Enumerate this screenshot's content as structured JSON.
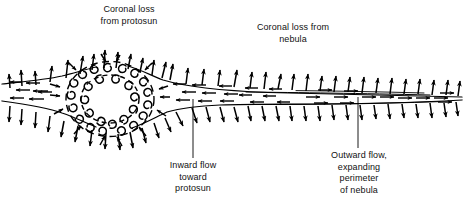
{
  "figure": {
    "kind": "scientific-line-diagram",
    "ink_color": "#000000",
    "background_color": "#ffffff"
  },
  "labels": {
    "coronal_loss_protosun": "Coronal loss\nfrom protosun",
    "coronal_loss_nebula": "Coronal loss from\nnebula",
    "inward_flow": "Inward flow\ntoward\nprotosun",
    "outward_flow": "Outward flow,\nexpanding\nperimeter\nof nebula"
  },
  "chart_data": {
    "type": "diagram",
    "elements": [
      {
        "name": "protosun-core",
        "shape": "annulus-of-convective-cells",
        "cx": 110,
        "cy": 100,
        "rx": 44,
        "ry": 38
      },
      {
        "name": "nebula-disk",
        "shape": "tapering-wedge",
        "x_from": 0,
        "x_to": 462,
        "midline_y": 100
      },
      {
        "name": "upward-arrow-field",
        "meaning": "coronal loss above disk",
        "count": 31
      },
      {
        "name": "downward-arrow-field",
        "meaning": "coronal loss below disk",
        "count": 29
      },
      {
        "name": "inflow-arrows",
        "meaning": "inward flow toward protosun",
        "direction": "leftward along disk"
      },
      {
        "name": "outflow-arrows",
        "meaning": "outward flow, expanding perimeter",
        "direction": "rightward along disk"
      }
    ],
    "leaders": [
      {
        "name": "inward-flow-leader",
        "x": 193,
        "y_from": 99,
        "y_to": 158
      },
      {
        "name": "outward-flow-leader",
        "x": 358,
        "y_from": 97,
        "y_to": 148
      }
    ]
  }
}
